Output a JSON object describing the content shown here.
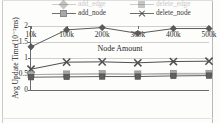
{
  "figure": {
    "background": "#fdfdfc",
    "frame_color": "#c9c9c7"
  },
  "legend": {
    "position": "top",
    "rows": [
      [
        {
          "label": "add_edge",
          "marker": "triangle-marker",
          "color": "#6f6f6f",
          "faded": true
        },
        {
          "label": "delete_edge",
          "marker": "square-marker",
          "color": "#6f6f6f",
          "faded": true
        }
      ],
      [
        {
          "label": "add_node",
          "marker": "square-light-marker",
          "color": "#a8a8a8",
          "faded": false
        },
        {
          "label": "delete_node",
          "marker": "x-marker",
          "color": "#4f4f4f",
          "faded": false
        }
      ]
    ]
  },
  "chart_data": {
    "type": "line",
    "title": "",
    "xlabel": "Node Amount",
    "ylabel": "Avg Update Time(10⁻²ms)",
    "categories": [
      "10k",
      "100k",
      "200k",
      "300k",
      "400k",
      "500k"
    ],
    "ylim": [
      0,
      2
    ],
    "yticks": [
      0,
      0.5,
      1,
      1.5,
      2
    ],
    "ytick_labels": [
      "0",
      "0.5",
      "1",
      "1.5",
      "2"
    ],
    "grid": true,
    "grid_axis": "y",
    "legend_position": "top",
    "series": [
      {
        "name": "delete_node",
        "marker": "diamond",
        "color": "#5a5a5a",
        "values": [
          1.35,
          1.88,
          1.95,
          1.77,
          1.92,
          1.92
        ]
      },
      {
        "name": "add_node",
        "marker": "x",
        "color": "#4f4f4f",
        "values": [
          0.65,
          0.87,
          0.88,
          0.85,
          0.89,
          0.9
        ]
      },
      {
        "name": "delete_edge",
        "marker": "square",
        "color": "#a8a8a8",
        "values": [
          0.48,
          0.5,
          0.51,
          0.5,
          0.52,
          0.52
        ]
      },
      {
        "name": "add_edge",
        "marker": "square-dark",
        "color": "#5f5f5f",
        "values": [
          0.4,
          0.41,
          0.42,
          0.42,
          0.44,
          0.45
        ]
      }
    ]
  }
}
